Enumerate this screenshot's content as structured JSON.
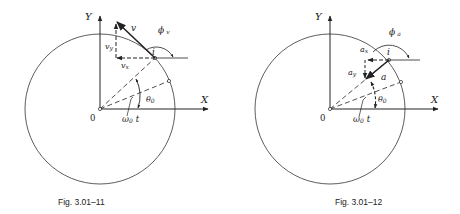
{
  "figures": [
    {
      "id": "fig1",
      "caption": "Fig. 3.01–11",
      "labels": {
        "y_axis": "Y",
        "x_axis": "X",
        "origin": "0",
        "point": "i",
        "vector": "v",
        "vector_x": "v",
        "vector_x_sub": "x",
        "vector_y": "v",
        "vector_y_sub": "y",
        "angle_phi": "ϕ",
        "angle_phi_sub": "v",
        "angle_theta": "θ",
        "angle_theta_sub": "0",
        "angle_omega": "ω",
        "angle_omega_sub": "0",
        "angle_omega_t": "t"
      }
    },
    {
      "id": "fig2",
      "caption": "Fig. 3.01–12",
      "labels": {
        "y_axis": "Y",
        "x_axis": "X",
        "origin": "0",
        "point": "i",
        "vector": "a",
        "vector_x": "a",
        "vector_x_sub": "x",
        "vector_y": "a",
        "vector_y_sub": "y",
        "angle_phi": "ϕ",
        "angle_phi_sub": "a",
        "angle_theta": "θ",
        "angle_theta_sub": "0",
        "angle_omega": "ω",
        "angle_omega_sub": "0",
        "angle_omega_t": "t"
      }
    }
  ],
  "colors": {
    "ink": "#222222",
    "background": "#ffffff"
  }
}
